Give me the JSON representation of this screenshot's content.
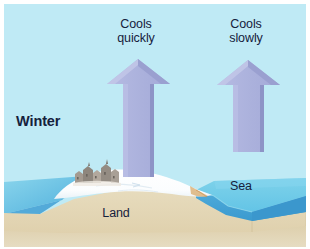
{
  "diagram": {
    "season_label": "Winter",
    "labels": {
      "cools_quickly": "Cools\nquickly",
      "cools_slowly": "Cools\nslowly",
      "land": "Land",
      "sea": "Sea"
    },
    "arrows": [
      {
        "name": "land-cooling-arrow",
        "label": "Cools quickly",
        "direction": "up",
        "over": "land",
        "relative_length": "long"
      },
      {
        "name": "sea-cooling-arrow",
        "label": "Cools slowly",
        "direction": "up",
        "over": "sea",
        "relative_length": "short"
      }
    ],
    "colors": {
      "sky": "#bfeaf5",
      "border": "#ffffff",
      "arrow_body": "#aeb4de",
      "arrow_shade": "#8d94c6",
      "arrow_highlight": "#c2c7e8",
      "sand_top": "#e3d5b2",
      "sand_front": "#d6c49c",
      "sea_top": "#6ecbe8",
      "sea_front": "#3f9fd4",
      "snow": "#ffffff",
      "snow_shadow": "#e4eef5",
      "village": "#9a9289",
      "text": "#15213c"
    }
  }
}
